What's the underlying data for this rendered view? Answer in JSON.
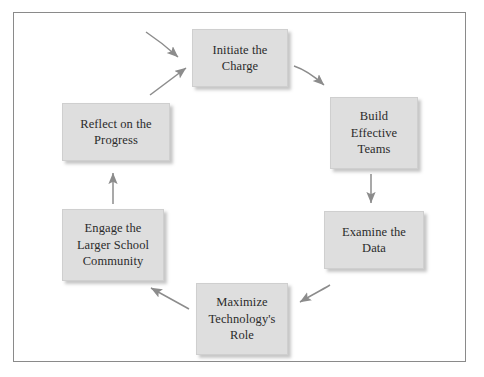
{
  "diagram": {
    "type": "cycle-flow-diagram",
    "frame": {
      "border_color": "#8a8a8a",
      "background": "#ffffff"
    },
    "node_style": {
      "fill": "#dedede",
      "text_color": "#2b2b2b",
      "shadow": true
    },
    "arrow_color": "#8c8c8c",
    "nodes": [
      {
        "id": "initiate",
        "label": "Initiate the\nCharge",
        "lines": [
          "Initiate the",
          "Charge"
        ]
      },
      {
        "id": "build",
        "label": "Build\nEffective\nTeams",
        "lines": [
          "Build",
          "Effective",
          "Teams"
        ]
      },
      {
        "id": "examine",
        "label": "Examine the\nData",
        "lines": [
          "Examine the",
          "Data"
        ]
      },
      {
        "id": "maximize",
        "label": "Maximize\nTechnology's\nRole",
        "lines": [
          "Maximize",
          "Technology's",
          "Role"
        ]
      },
      {
        "id": "engage",
        "label": "Engage the\nLarger School\nCommunity",
        "lines": [
          "Engage the",
          "Larger School",
          "Community"
        ]
      },
      {
        "id": "reflect",
        "label": "Reflect on the\nProgress",
        "lines": [
          "Reflect on the",
          "Progress"
        ]
      }
    ],
    "edges": [
      {
        "from": "entry",
        "to": "initiate",
        "direction": "down-right",
        "style": "curved"
      },
      {
        "from": "initiate",
        "to": "build",
        "direction": "down-right",
        "style": "curved"
      },
      {
        "from": "build",
        "to": "examine",
        "direction": "down",
        "style": "straight"
      },
      {
        "from": "examine",
        "to": "maximize",
        "direction": "down-left",
        "style": "curved"
      },
      {
        "from": "maximize",
        "to": "engage",
        "direction": "up-left",
        "style": "straight"
      },
      {
        "from": "engage",
        "to": "reflect",
        "direction": "up",
        "style": "straight"
      },
      {
        "from": "reflect",
        "to": "initiate",
        "direction": "up-right",
        "style": "straight"
      }
    ]
  }
}
